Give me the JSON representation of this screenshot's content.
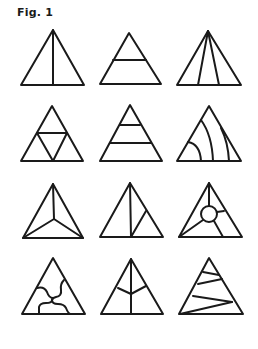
{
  "figure": {
    "label": "Fig. 1",
    "stroke_color": "#1a1a1a",
    "background": "#ffffff",
    "layout": {
      "rows": 4,
      "cols": 3
    },
    "triangles": [
      {
        "id": 1,
        "description": "single vertical line from apex to base"
      },
      {
        "id": 2,
        "description": "one horizontal line at mid-height"
      },
      {
        "id": 3,
        "description": "two lines fanning from apex to base"
      },
      {
        "id": 4,
        "description": "midpoint subdivision into four triangles"
      },
      {
        "id": 5,
        "description": "two horizontal bands"
      },
      {
        "id": 6,
        "description": "three curved arcs to base"
      },
      {
        "id": 7,
        "description": "three lines from vertices to center"
      },
      {
        "id": 8,
        "description": "vertical line plus diagonal to right edge"
      },
      {
        "id": 9,
        "description": "central circle with four spokes"
      },
      {
        "id": 10,
        "description": "interlocking wavy puzzle divisions"
      },
      {
        "id": 11,
        "description": "vertical line with two branches (leaf)"
      },
      {
        "id": 12,
        "description": "zigzag lines across triangle"
      }
    ]
  }
}
